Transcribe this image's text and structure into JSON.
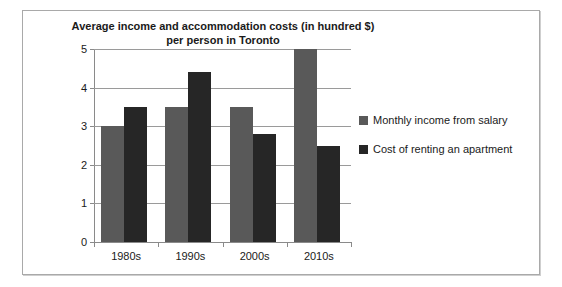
{
  "chart_data": {
    "type": "bar",
    "title": "Average income and accommodation costs (in hundred $) per person in Toronto",
    "title_lines": [
      "Average income and accommodation costs (in hundred $)",
      "per person in Toronto"
    ],
    "xlabel": "",
    "ylabel": "",
    "categories": [
      "1980s",
      "1990s",
      "2000s",
      "2010s"
    ],
    "series": [
      {
        "name": "Monthly income from salary",
        "color": "#595959",
        "values": [
          3.0,
          3.5,
          3.5,
          5.0
        ]
      },
      {
        "name": "Cost of renting an apartment",
        "color": "#262626",
        "values": [
          3.5,
          4.4,
          2.8,
          2.5
        ]
      }
    ],
    "ylim": [
      0,
      5
    ],
    "y_ticks": [
      0,
      1,
      2,
      3,
      4,
      5
    ],
    "y_tick_labels": [
      "0",
      "1",
      "2",
      "3",
      "4",
      "5"
    ],
    "grid": true,
    "legend_position": "right"
  },
  "legend": {
    "entries": [
      {
        "label": "Monthly income from salary"
      },
      {
        "label": "Cost of renting an apartment"
      }
    ]
  }
}
